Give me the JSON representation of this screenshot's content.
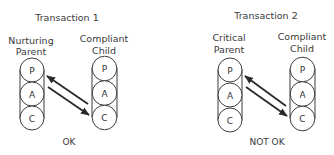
{
  "transactions": [
    {
      "title": "Transaction 1",
      "sender": {
        "label_line1": "Nurturing",
        "label_line2": "Parent",
        "states": [
          "P",
          "A",
          "C"
        ]
      },
      "receiver": {
        "label_line1": "Compliant",
        "label_line2": "Child",
        "states": [
          "P",
          "A",
          "C"
        ]
      },
      "arrows": [
        {
          "from": "receiver.C",
          "to": "sender.P",
          "direction": "up-left"
        },
        {
          "from": "sender.P",
          "to": "receiver.C",
          "direction": "down-right"
        }
      ],
      "verdict": "OK"
    },
    {
      "title": "Transaction 2",
      "sender": {
        "label_line1": "Critical",
        "label_line2": "Parent",
        "states": [
          "P",
          "A",
          "C"
        ]
      },
      "receiver": {
        "label_line1": "Compliant",
        "label_line2": "Child",
        "states": [
          "P",
          "A",
          "C"
        ]
      },
      "arrows": [
        {
          "from": "receiver.C",
          "to": "sender.P",
          "direction": "up-left"
        },
        {
          "from": "sender.P",
          "to": "receiver.C",
          "direction": "down-right"
        }
      ],
      "verdict": "NOT OK"
    }
  ],
  "colors": {
    "stroke": "#3c3c3c",
    "text": "#3a3a3a",
    "arrow": "#2a2a2a"
  }
}
